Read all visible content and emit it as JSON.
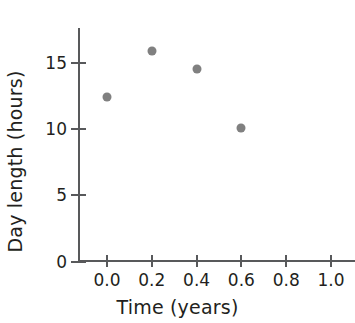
{
  "chart_data": {
    "type": "scatter",
    "title": "",
    "xlabel": "Time (years)",
    "ylabel": "Day length (hours)",
    "xlim": [
      0.0,
      1.05
    ],
    "ylim": [
      0,
      17.5
    ],
    "xticks": [
      "0.0",
      "0.2",
      "0.4",
      "0.6",
      "0.8",
      "1.0"
    ],
    "xtick_values": [
      0.0,
      0.2,
      0.4,
      0.6,
      0.8,
      1.0
    ],
    "yticks": [
      "0",
      "5",
      "10",
      "15"
    ],
    "ytick_values": [
      0,
      5,
      10,
      15
    ],
    "grid": false,
    "legend": false,
    "legend_position": "none",
    "marker_color": "#808080",
    "axis_color": "#58595b",
    "text_color": "#231f20",
    "x": [
      0.0,
      0.2,
      0.4,
      0.6
    ],
    "values": [
      12.4,
      15.9,
      14.5,
      10.1
    ],
    "points": [
      {
        "x": 0.0,
        "y": 12.4
      },
      {
        "x": 0.2,
        "y": 15.9
      },
      {
        "x": 0.4,
        "y": 14.5
      },
      {
        "x": 0.6,
        "y": 10.1
      }
    ]
  }
}
